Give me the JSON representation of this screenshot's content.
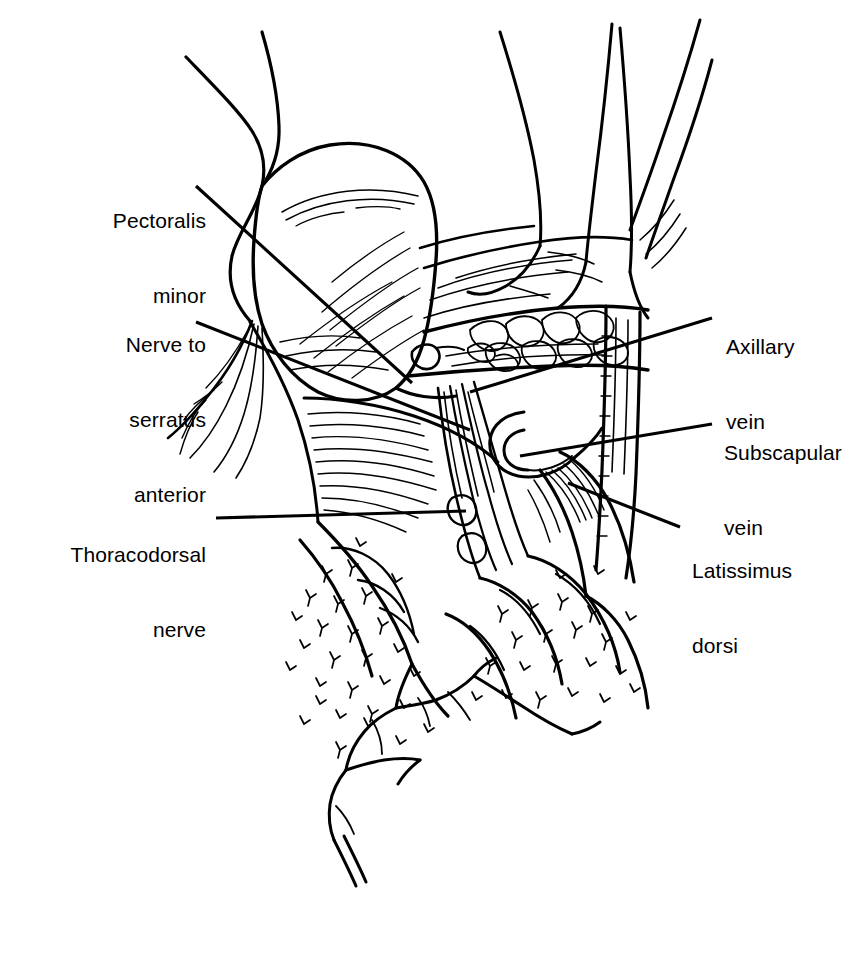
{
  "figure": {
    "kind": "anatomical-line-drawing",
    "region": "axilla",
    "background_color": "#ffffff",
    "ink_color": "#000000",
    "width": 865,
    "height": 955
  },
  "labels": [
    {
      "id": "pectoralis-minor",
      "text": "Pectoralis\nminor",
      "line1": "Pectoralis",
      "line2": "minor",
      "align": "right",
      "x": 88,
      "y": 158,
      "box_width": 118,
      "leader": {
        "x1": 196,
        "y1": 186,
        "x2": 412,
        "y2": 383
      }
    },
    {
      "id": "nerve-to-serratus-anterior",
      "text": "Nerve to\nserratus\nanterior",
      "line1": "Nerve to",
      "line2": "serratus",
      "line3": "anterior",
      "align": "right",
      "x": 70,
      "y": 282,
      "box_width": 136,
      "leader": {
        "x1": 196,
        "y1": 322,
        "x2": 470,
        "y2": 430
      }
    },
    {
      "id": "thoracodorsal-nerve",
      "text": "Thoracodorsal\nnerve",
      "line1": "Thoracodorsal",
      "line2": "nerve",
      "align": "right",
      "x": 24,
      "y": 492,
      "box_width": 182,
      "leader": {
        "x1": 216,
        "y1": 518,
        "x2": 466,
        "y2": 511
      }
    },
    {
      "id": "axillary-vein",
      "text": "Axillary\nvein",
      "line1": "Axillary",
      "line2": "vein",
      "align": "left",
      "x": 726,
      "y": 284,
      "box_width": 130,
      "leader": {
        "x1": 712,
        "y1": 318,
        "x2": 470,
        "y2": 392
      }
    },
    {
      "id": "subscapular-vein",
      "text": "Subscapular\nvein",
      "line1": "Subscapular",
      "line2": "vein",
      "align": "left",
      "x": 724,
      "y": 390,
      "box_width": 140,
      "leader": {
        "x1": 712,
        "y1": 424,
        "x2": 520,
        "y2": 456
      }
    },
    {
      "id": "latissimus-dorsi",
      "text": "Latissimus\ndorsi",
      "line1": "Latissimus",
      "line2": "dorsi",
      "align": "left",
      "x": 692,
      "y": 508,
      "box_width": 140,
      "leader": {
        "x1": 680,
        "y1": 527,
        "x2": 568,
        "y2": 483
      }
    }
  ]
}
